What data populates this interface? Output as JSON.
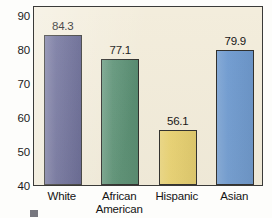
{
  "chart_data": {
    "type": "bar",
    "title": "",
    "xlabel": "",
    "ylabel": "",
    "ylim": [
      40,
      93
    ],
    "grid": false,
    "legend": "none",
    "categories": [
      "White",
      "African American",
      "Hispanic",
      "Asian"
    ],
    "category_lines": [
      [
        "White"
      ],
      [
        "African",
        "American"
      ],
      [
        "Hispanic"
      ],
      [
        "Asian"
      ]
    ],
    "values": [
      84.3,
      77.1,
      56.1,
      79.9
    ],
    "value_labels": [
      "84.3",
      "77.1",
      "56.1",
      "79.9"
    ],
    "bar_colors": [
      "#5b5d8e",
      "#5a9175",
      "#e9d271",
      "#6f9bd1"
    ],
    "y_ticks": [
      40,
      50,
      60,
      70,
      80,
      90
    ],
    "y_tick_labels": [
      "40",
      "50",
      "60",
      "70",
      "80",
      "90"
    ]
  },
  "colors": {
    "plot_background": "#f3eddc",
    "frame": "#3a3a38",
    "text": "#141414",
    "bar_white": "#5b5d8e",
    "bar_african_american": "#5a9175",
    "bar_hispanic": "#e9d271",
    "bar_asian": "#6f9bd1"
  }
}
